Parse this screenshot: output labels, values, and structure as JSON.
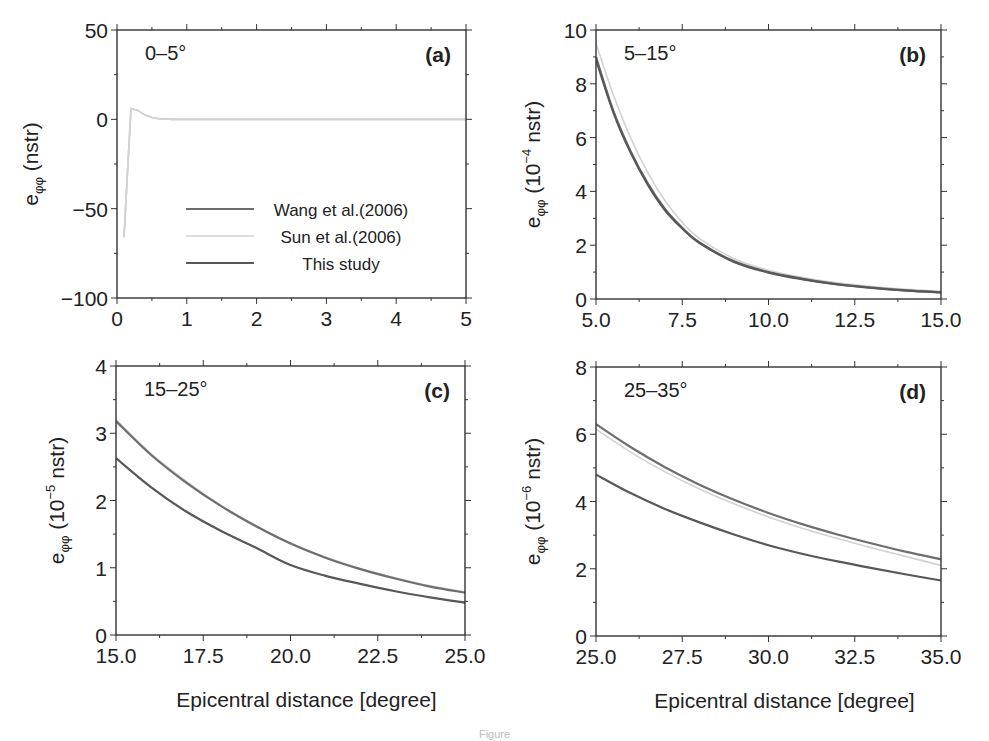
{
  "figure": {
    "caption_fragment": "Figure",
    "legend": {
      "items": [
        {
          "label": "Wang et al.(2006)",
          "color": "#6e6e6e",
          "width": 2.2
        },
        {
          "label": "Sun et al.(2006)",
          "color": "#d2d2d2",
          "width": 1.6
        },
        {
          "label": "This study",
          "color": "#585858",
          "width": 2.2
        }
      ]
    },
    "shared_xlabel": "Epicentral distance [degree]"
  },
  "chart_data": [
    {
      "type": "line",
      "panel": "(a)",
      "annotation": "0–5°",
      "ylabel_main": "e",
      "ylabel_sub": "φφ",
      "ylabel_unit": "(nstr)",
      "ylabel_exp": "",
      "xlabel": "",
      "xlim": [
        0,
        5
      ],
      "ylim": [
        -100,
        50
      ],
      "xticks": [
        0,
        1,
        2,
        3,
        4,
        5
      ],
      "xtick_labels": [
        "0",
        "1",
        "2",
        "3",
        "4",
        "5"
      ],
      "xminor": 0.5,
      "yticks": [
        -100,
        -50,
        0,
        50
      ],
      "ytick_labels": [
        "−100",
        "−50",
        "0",
        "50"
      ],
      "yminor": 25,
      "box": {
        "x": 117,
        "y": 30,
        "w": 349,
        "h": 268
      },
      "series": [
        {
          "name": "Wang et al.(2006)",
          "x": [
            0.1,
            0.2,
            0.3,
            0.4,
            0.5,
            0.6,
            0.8,
            1.0,
            2.0,
            3.0,
            4.0,
            5.0
          ],
          "y": [
            -66,
            6,
            5,
            2.5,
            1,
            0.3,
            0,
            0,
            0,
            0,
            0,
            0
          ]
        },
        {
          "name": "Sun et al.(2006)",
          "x": [
            0.1,
            0.2,
            0.3,
            0.4,
            0.5,
            0.6,
            0.8,
            1.0,
            2.0,
            3.0,
            4.0,
            5.0
          ],
          "y": [
            -66,
            6,
            5,
            2.5,
            1,
            0.3,
            0,
            0,
            0,
            0,
            0,
            0
          ]
        },
        {
          "name": "This study",
          "x": [
            0.1,
            0.2,
            0.3,
            0.4,
            0.5,
            0.6,
            0.8,
            1.0,
            2.0,
            3.0,
            4.0,
            5.0
          ],
          "y": [
            -66,
            6,
            5,
            2.5,
            1,
            0.3,
            0,
            0,
            0,
            0,
            0,
            0
          ]
        }
      ],
      "show_legend": true
    },
    {
      "type": "line",
      "panel": "(b)",
      "annotation": "5–15°",
      "ylabel_main": "e",
      "ylabel_sub": "φφ",
      "ylabel_unit": "(10",
      "ylabel_exp": "−4",
      "ylabel_tail": " nstr)",
      "xlabel": "",
      "xlim": [
        5,
        15
      ],
      "ylim": [
        0,
        10
      ],
      "xticks": [
        5,
        7.5,
        10,
        12.5,
        15
      ],
      "xtick_labels": [
        "5.0",
        "7.5",
        "10.0",
        "12.5",
        "15.0"
      ],
      "xminor": 1.25,
      "yticks": [
        0,
        2,
        4,
        6,
        8,
        10
      ],
      "ytick_labels": [
        "0",
        "2",
        "4",
        "6",
        "8",
        "10"
      ],
      "yminor": 1,
      "box": {
        "x": 596,
        "y": 30,
        "w": 345,
        "h": 269
      },
      "series": [
        {
          "name": "Wang et al.(2006)",
          "x": [
            5,
            5.5,
            6,
            6.5,
            7,
            7.5,
            8,
            9,
            10,
            11,
            12,
            13,
            14,
            15
          ],
          "y": [
            9.0,
            7.0,
            5.5,
            4.3,
            3.35,
            2.65,
            2.1,
            1.4,
            1.0,
            0.75,
            0.55,
            0.42,
            0.32,
            0.25
          ]
        },
        {
          "name": "Sun et al.(2006)",
          "x": [
            5,
            5.5,
            6,
            6.5,
            7,
            7.5,
            8,
            9,
            10,
            11,
            12,
            13,
            14,
            15
          ],
          "y": [
            9.5,
            7.6,
            6.0,
            4.7,
            3.65,
            2.85,
            2.25,
            1.5,
            1.07,
            0.8,
            0.6,
            0.46,
            0.36,
            0.28
          ]
        },
        {
          "name": "This study",
          "x": [
            5,
            5.5,
            6,
            6.5,
            7,
            7.5,
            8,
            9,
            10,
            11,
            12,
            13,
            14,
            15
          ],
          "y": [
            8.9,
            6.95,
            5.45,
            4.25,
            3.3,
            2.62,
            2.08,
            1.38,
            0.98,
            0.73,
            0.54,
            0.41,
            0.31,
            0.24
          ]
        }
      ],
      "show_legend": false
    },
    {
      "type": "line",
      "panel": "(c)",
      "annotation": "15–25°",
      "ylabel_main": "e",
      "ylabel_sub": "φφ",
      "ylabel_unit": "(10",
      "ylabel_exp": "−5",
      "ylabel_tail": " nstr)",
      "xlabel": "Epicentral distance [degree]",
      "xlim": [
        15,
        25
      ],
      "ylim": [
        0,
        4
      ],
      "xticks": [
        15,
        17.5,
        20,
        22.5,
        25
      ],
      "xtick_labels": [
        "15.0",
        "17.5",
        "20.0",
        "22.5",
        "25.0"
      ],
      "xminor": 1.25,
      "yticks": [
        0,
        1,
        2,
        3,
        4
      ],
      "ytick_labels": [
        "0",
        "1",
        "2",
        "3",
        "4"
      ],
      "yminor": 0.5,
      "box": {
        "x": 116,
        "y": 366,
        "w": 349,
        "h": 269
      },
      "series": [
        {
          "name": "Wang et al.(2006)",
          "x": [
            15,
            16,
            17,
            18,
            19,
            20,
            21,
            22,
            23,
            24,
            25
          ],
          "y": [
            3.18,
            2.68,
            2.27,
            1.92,
            1.62,
            1.36,
            1.15,
            0.98,
            0.84,
            0.72,
            0.63
          ]
        },
        {
          "name": "Sun et al.(2006)",
          "x": [
            15,
            16,
            17,
            18,
            19,
            20,
            21,
            22,
            23,
            24,
            25
          ],
          "y": [
            3.2,
            2.7,
            2.29,
            1.93,
            1.63,
            1.37,
            1.16,
            0.99,
            0.85,
            0.73,
            0.64
          ]
        },
        {
          "name": "This study",
          "x": [
            15,
            16,
            17,
            18,
            19,
            20,
            21,
            22,
            23,
            24,
            25
          ],
          "y": [
            2.63,
            2.2,
            1.84,
            1.55,
            1.3,
            1.04,
            0.88,
            0.76,
            0.65,
            0.56,
            0.48
          ]
        }
      ],
      "show_legend": false
    },
    {
      "type": "line",
      "panel": "(d)",
      "annotation": "25–35°",
      "ylabel_main": "e",
      "ylabel_sub": "φφ",
      "ylabel_unit": "(10",
      "ylabel_exp": "−6",
      "ylabel_tail": " nstr)",
      "xlabel": "Epicentral distance [degree]",
      "xlim": [
        25,
        35
      ],
      "ylim": [
        0,
        8
      ],
      "xticks": [
        25,
        27.5,
        30,
        32.5,
        35
      ],
      "xtick_labels": [
        "25.0",
        "27.5",
        "30.0",
        "32.5",
        "35.0"
      ],
      "xminor": 1.25,
      "yticks": [
        0,
        2,
        4,
        6,
        8
      ],
      "ytick_labels": [
        "0",
        "2",
        "4",
        "6",
        "8"
      ],
      "yminor": 1,
      "box": {
        "x": 596,
        "y": 367,
        "w": 345,
        "h": 269
      },
      "series": [
        {
          "name": "Wang et al.(2006)",
          "x": [
            25,
            26,
            27,
            28,
            29,
            30,
            31,
            32,
            33,
            34,
            35
          ],
          "y": [
            6.3,
            5.62,
            5.02,
            4.5,
            4.05,
            3.66,
            3.32,
            3.02,
            2.75,
            2.5,
            2.28
          ]
        },
        {
          "name": "Sun et al.(2006)",
          "x": [
            25,
            26,
            27,
            28,
            29,
            30,
            31,
            32,
            33,
            34,
            35
          ],
          "y": [
            6.15,
            5.47,
            4.88,
            4.37,
            3.93,
            3.54,
            3.2,
            2.9,
            2.62,
            2.36,
            2.1
          ]
        },
        {
          "name": "This study",
          "x": [
            25,
            26,
            27,
            28,
            29,
            30,
            31,
            32,
            33,
            34,
            35
          ],
          "y": [
            4.8,
            4.25,
            3.78,
            3.38,
            3.02,
            2.7,
            2.44,
            2.22,
            2.02,
            1.83,
            1.65
          ]
        }
      ],
      "show_legend": false
    }
  ]
}
